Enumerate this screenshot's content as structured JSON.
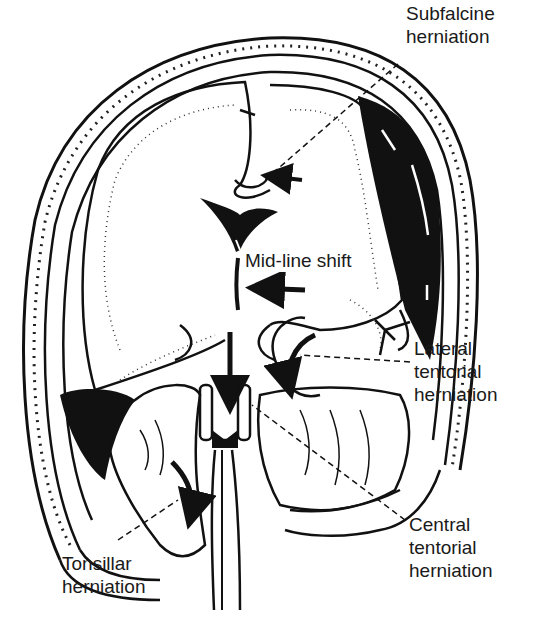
{
  "figure": {
    "colors": {
      "ink": "#111111",
      "paper": "#ffffff",
      "stipple": "#555555"
    }
  },
  "labels": {
    "subfalcine": {
      "line1": "Subfalcine",
      "line2": "herniation"
    },
    "midline": {
      "line1": "Mid-line shift"
    },
    "lateral": {
      "line1": "Lateral",
      "line2": "tentorial",
      "line3": "herniation"
    },
    "central": {
      "line1": "Central",
      "line2": "tentorial",
      "line3": "herniation"
    },
    "tonsillar": {
      "line1": "Tonsillar",
      "line2": "herniation"
    }
  }
}
